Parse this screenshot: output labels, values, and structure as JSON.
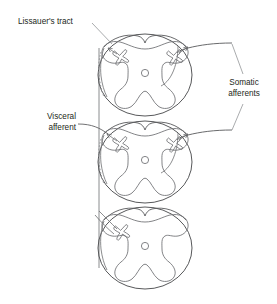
{
  "figure": {
    "background_color": "#ffffff",
    "stroke_color": "#58595b",
    "text_color": "#231f20",
    "tract_dash_color": "#8d8f92"
  },
  "labels": {
    "lissauers_tract": "Lissauer's tract",
    "visceral_afferent_line1": "Visceral",
    "visceral_afferent_line2": "afferent",
    "somatic_afferents_line1": "Somatic",
    "somatic_afferents_line2": "afferents"
  },
  "sections": [
    {
      "name": "upper-cord-section",
      "cx": 145,
      "cy": 75,
      "markers": [
        "left-neuron-x",
        "right-neuron-x"
      ],
      "central_canal": true
    },
    {
      "name": "middle-cord-section",
      "cx": 145,
      "cy": 162,
      "markers": [
        "left-neuron-x",
        "right-neuron-x"
      ],
      "central_canal": true
    },
    {
      "name": "lower-cord-section",
      "cx": 145,
      "cy": 248,
      "markers": [
        "left-neuron-x"
      ],
      "central_canal": true
    }
  ],
  "annotations": {
    "lissauers_tract_leader": "line from label to dorsolateral tract of upper section",
    "visceral_afferent_leader": "line from label to dorsal root entry of middle section",
    "somatic_afferents_leaders": "two lines from label to afferent fibers of upper and middle sections",
    "vertical_tract": "dashed ascending/descending Lissauer's tract linking all three sections"
  }
}
